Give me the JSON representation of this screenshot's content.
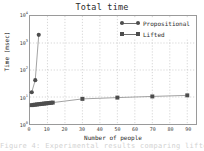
{
  "chart_data": {
    "type": "line",
    "title": "Total time",
    "xlabel": "Number of people",
    "ylabel": "Time (msec)",
    "yscale": "log",
    "xscale": "linear",
    "xlim": [
      0,
      95
    ],
    "ylim": [
      1,
      10000
    ],
    "grid": true,
    "grid_style": "dotted",
    "legend_position": "upper right",
    "xticks": [
      0,
      10,
      20,
      30,
      40,
      50,
      60,
      70,
      80,
      90
    ],
    "xtick_labels": [
      "0",
      "10",
      "20",
      "30",
      "40",
      "50",
      "60",
      "70",
      "80",
      "90"
    ],
    "yticks": [
      1,
      10,
      100,
      1000,
      10000
    ],
    "ytick_labels": [
      "10⁰",
      "10¹",
      "10²",
      "10³",
      "10⁴"
    ],
    "ytick_mantissa": [
      "10",
      "10",
      "10",
      "10",
      "10"
    ],
    "ytick_exponent": [
      "0",
      "1",
      "2",
      "3",
      "4"
    ],
    "series": [
      {
        "name": "Propositional",
        "marker": "circle",
        "color": "#4d4d4d",
        "x": [
          1,
          3,
          5
        ],
        "y": [
          15,
          42,
          2000
        ]
      },
      {
        "name": "Lifted",
        "marker": "square",
        "color": "#4d4d4d",
        "x": [
          1,
          2,
          3,
          4,
          5,
          6,
          7,
          8,
          9,
          10,
          11,
          12,
          13,
          30,
          50,
          70,
          90
        ],
        "y": [
          5.0,
          5.1,
          5.2,
          5.3,
          5.4,
          5.5,
          5.6,
          5.7,
          5.8,
          5.9,
          6.0,
          6.1,
          6.2,
          8.5,
          9.5,
          10.5,
          11.5
        ]
      }
    ]
  },
  "legend": {
    "entries": [
      {
        "label": "Propositional",
        "marker": "circle"
      },
      {
        "label": "Lifted",
        "marker": "square"
      }
    ]
  },
  "caption_bleed": "Figure 4: Experimental results comparing lifted"
}
